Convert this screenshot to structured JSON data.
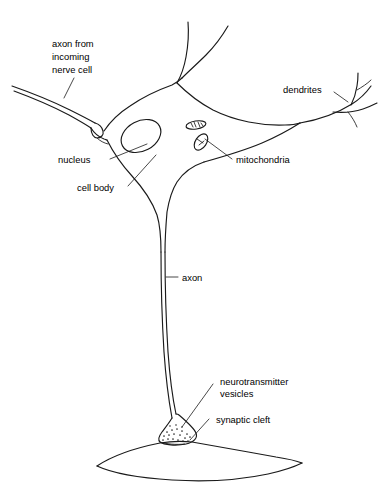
{
  "figure": {
    "kind": "biology-line-diagram",
    "background_color": "#ffffff",
    "ink_color": "#1a1a1a",
    "text_color": "#000000"
  },
  "labels": {
    "incoming_axon": {
      "name": "axon-from-incoming-nerve-cell",
      "lines": [
        "axon from",
        "incoming",
        "nerve cell"
      ],
      "line1": "axon from",
      "line2": "incoming",
      "line3": "nerve cell"
    },
    "dendrites": {
      "name": "dendrites",
      "text": "dendrites"
    },
    "nucleus": {
      "name": "nucleus",
      "text": "nucleus"
    },
    "cell_body": {
      "name": "cell-body",
      "text": "cell body"
    },
    "mitochondria": {
      "name": "mitochondria",
      "text": "mitochondria"
    },
    "axon": {
      "name": "axon",
      "text": "axon"
    },
    "neurotransmitter_vesicles": {
      "name": "neurotransmitter-vesicles",
      "lines": [
        "neurotransmitter",
        "vesicles"
      ],
      "line1": "neurotransmitter",
      "line2": "vesicles"
    },
    "synaptic_cleft": {
      "name": "synaptic-cleft",
      "text": "synaptic cleft"
    }
  },
  "parts": [
    "cell-body-outline",
    "nucleus-ellipse",
    "mitochondrion-upper",
    "mitochondrion-lower",
    "dendrite-top-branch",
    "dendrite-right-branch",
    "incoming-axon",
    "incoming-axon-terminal",
    "axon-shaft",
    "synaptic-terminal-bulb",
    "neurotransmitter-vesicle-dots",
    "postsynaptic-cell"
  ]
}
